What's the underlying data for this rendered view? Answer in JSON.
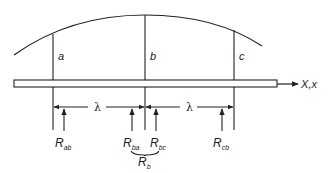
{
  "diagram": {
    "type": "beam-with-reactions",
    "colors": {
      "stroke": "#222222",
      "background": "#ffffff"
    },
    "sections": [
      {
        "id": "a",
        "label": "a"
      },
      {
        "id": "b",
        "label": "b"
      },
      {
        "id": "c",
        "label": "c"
      }
    ],
    "axis_label": "X,x",
    "spacing": [
      {
        "label": "λ"
      },
      {
        "label": "λ"
      }
    ],
    "reactions": [
      {
        "main": "R",
        "sub": "ab"
      },
      {
        "main": "R",
        "sub": "ba"
      },
      {
        "main": "R",
        "sub": "bc"
      },
      {
        "main": "R",
        "sub": "cb"
      }
    ],
    "combined_reaction": {
      "main": "R",
      "sub": "b"
    }
  }
}
